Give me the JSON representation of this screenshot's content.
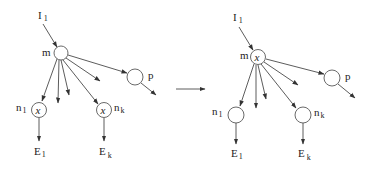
{
  "diagram": {
    "type": "graph-transformation",
    "left": {
      "name": "before",
      "input": {
        "label": "I",
        "sub": "1"
      },
      "nodes": [
        {
          "id": "m",
          "label": "m",
          "sub": "",
          "marker": ""
        },
        {
          "id": "p",
          "label": "p",
          "sub": "",
          "marker": ""
        },
        {
          "id": "n1",
          "label": "n",
          "sub": "1",
          "marker": "x"
        },
        {
          "id": "nk",
          "label": "n",
          "sub": "k",
          "marker": "x"
        }
      ],
      "outputs": [
        {
          "label": "E",
          "sub": "1"
        },
        {
          "label": "E",
          "sub": "k"
        }
      ]
    },
    "transition_arrow": "→",
    "right": {
      "name": "after",
      "input": {
        "label": "I",
        "sub": "1"
      },
      "nodes": [
        {
          "id": "m",
          "label": "m",
          "sub": "",
          "marker": "x"
        },
        {
          "id": "p",
          "label": "p",
          "sub": "",
          "marker": ""
        },
        {
          "id": "n1",
          "label": "n",
          "sub": "1",
          "marker": ""
        },
        {
          "id": "nk",
          "label": "n",
          "sub": "k",
          "marker": ""
        }
      ],
      "outputs": [
        {
          "label": "E",
          "sub": "1"
        },
        {
          "label": "E",
          "sub": "k"
        }
      ]
    },
    "edges_description": "I1 -> m; m fans out to n1, several unlabeled outputs, nk, and p; p has an outgoing arrow; n1 -> E1; nk -> Ek"
  }
}
